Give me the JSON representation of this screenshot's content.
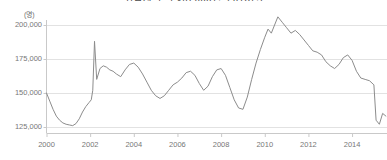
{
  "chart_data": {
    "type": "line",
    "title": "취업자 수 추이(2000년~2015년)",
    "subtitle": "",
    "xlabel": "",
    "ylabel": "",
    "unit_label": "(명)",
    "grid": true,
    "legend": "none",
    "xlim": [
      2000.0,
      2015.6
    ],
    "ylim": [
      118000,
      210000
    ],
    "ytick_labels": [
      "200,000",
      "175,000",
      "150,000",
      "125,000"
    ],
    "ytick_values": [
      200000,
      175000,
      150000,
      125000
    ],
    "xtick_labels": [
      "2000",
      "2002",
      "2004",
      "2006",
      "2008",
      "2010",
      "2012",
      "2014"
    ],
    "xtick_values": [
      2000,
      2002,
      2004,
      2006,
      2008,
      2010,
      2012,
      2014
    ],
    "series": [
      {
        "name": "취업자 수",
        "color": "#8c8c8c",
        "x": [
          2000.0,
          2000.15,
          2000.3,
          2000.45,
          2000.6,
          2000.75,
          2000.9,
          2001.05,
          2001.2,
          2001.35,
          2001.5,
          2001.65,
          2001.8,
          2001.95,
          2002.05,
          2002.12,
          2002.2,
          2002.3,
          2002.45,
          2002.6,
          2002.75,
          2002.9,
          2003.05,
          2003.2,
          2003.4,
          2003.6,
          2003.8,
          2004.0,
          2004.2,
          2004.4,
          2004.6,
          2004.8,
          2005.0,
          2005.2,
          2005.4,
          2005.6,
          2005.8,
          2006.0,
          2006.2,
          2006.4,
          2006.6,
          2006.8,
          2007.0,
          2007.2,
          2007.4,
          2007.6,
          2007.8,
          2008.0,
          2008.2,
          2008.4,
          2008.6,
          2008.8,
          2009.0,
          2009.2,
          2009.4,
          2009.6,
          2009.8,
          2010.0,
          2010.15,
          2010.3,
          2010.45,
          2010.6,
          2010.8,
          2011.0,
          2011.2,
          2011.4,
          2011.6,
          2011.8,
          2012.0,
          2012.2,
          2012.4,
          2012.6,
          2012.8,
          2013.0,
          2013.2,
          2013.4,
          2013.6,
          2013.8,
          2014.0,
          2014.2,
          2014.4,
          2014.6,
          2014.8,
          2015.0,
          2015.1,
          2015.25,
          2015.4,
          2015.55
        ],
        "y": [
          150000,
          144000,
          138000,
          133000,
          130000,
          128000,
          127000,
          126500,
          126000,
          127500,
          131000,
          136000,
          140000,
          143000,
          145000,
          152000,
          188000,
          160000,
          168000,
          170000,
          169000,
          167000,
          166000,
          164000,
          162000,
          167000,
          171000,
          172000,
          169000,
          164000,
          158000,
          152000,
          148000,
          146000,
          148000,
          152000,
          156000,
          158000,
          161000,
          165000,
          166000,
          163000,
          157000,
          152000,
          155000,
          162000,
          167000,
          168000,
          163000,
          154000,
          145000,
          139000,
          138000,
          147000,
          160000,
          172000,
          182000,
          191000,
          197000,
          194000,
          200000,
          206000,
          202000,
          198000,
          194000,
          196000,
          193000,
          189000,
          185000,
          181000,
          180000,
          178000,
          173000,
          170000,
          168000,
          171000,
          176000,
          178000,
          174000,
          166000,
          161000,
          160000,
          159000,
          156000,
          130000,
          127000,
          135000,
          133000
        ]
      }
    ]
  }
}
